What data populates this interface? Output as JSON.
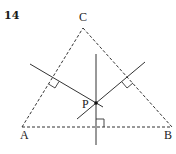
{
  "figure": {
    "problem_number": "14",
    "labels": {
      "A": "A",
      "B": "B",
      "C": "C",
      "P": "P"
    },
    "vertices": {
      "A": [
        22,
        127
      ],
      "B": [
        172,
        127
      ],
      "C": [
        83,
        28
      ]
    },
    "point_P": [
      96,
      103
    ],
    "triangle_style": "dashed",
    "perpendicular_bisectors": [
      {
        "side": "AC",
        "from": [
          30,
          64
        ],
        "to": [
          103,
          107
        ]
      },
      {
        "side": "AB",
        "from": [
          96,
          54
        ],
        "to": [
          96,
          145
        ]
      },
      {
        "side": "BC",
        "from": [
          77,
          119
        ],
        "to": [
          145,
          62
        ]
      }
    ],
    "right_angle_markers": 3,
    "line_color": "#333333"
  }
}
